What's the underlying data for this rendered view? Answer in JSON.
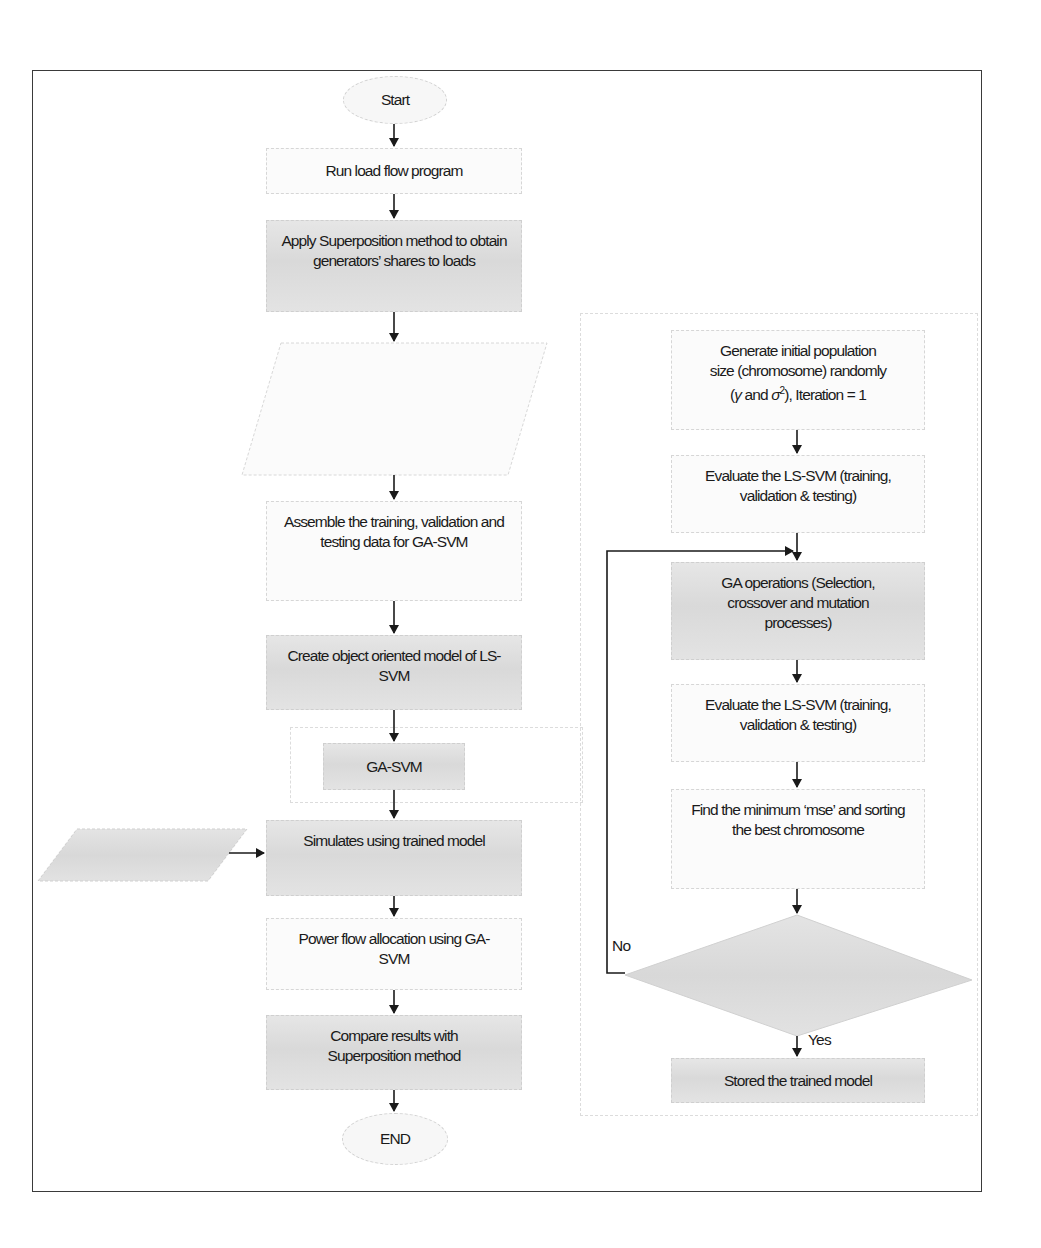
{
  "diagram": {
    "type": "flowchart",
    "left_flow": {
      "start": "Start",
      "steps": [
        "Run load flow program",
        "Apply Superposition method to obtain generators’ shares to loads",
        "Construct input data from load profile and target data from Superposition method",
        "Assemble the training, validation and testing data for GA-SVM",
        "Create object oriented model of LS-SVM",
        "GA-SVM",
        "Simulates using trained model",
        "Power flow allocation using GA-SVM",
        "Compare results with Superposition method"
      ],
      "new_input": "New input",
      "end": "END"
    },
    "right_flow": {
      "steps": [
        "Generate initial population size (chromosome) randomly (γ and σ², Iteration = 1",
        "Evaluate the LS-SVM (training, validation & testing)",
        "GA operations (Selection, crossover and mutation processes)",
        "Evaluate the LS-SVM (training, validation & testing)",
        "Find the minimum ‘mse’ and sorting the best chromosome"
      ],
      "step1_lines": [
        "Generate initial population",
        "size (chromosome) randomly",
        "(γ and σ",
        "2",
        "), Iteration = 1"
      ],
      "decision": "Maximum iteration?",
      "no_label": "No",
      "yes_label": "Yes",
      "final": "Stored the trained model"
    }
  }
}
